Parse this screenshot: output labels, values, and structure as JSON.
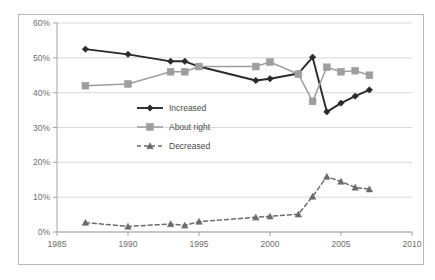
{
  "chart_data": {
    "type": "line",
    "title": "",
    "subtitle": "",
    "xlabel": "",
    "ylabel": "",
    "xlim": [
      1985,
      2010
    ],
    "ylim": [
      0,
      60
    ],
    "grid": true,
    "legend_position": "inside-center-left",
    "x_tick_labels": [
      "1985",
      "1990",
      "1995",
      "2000",
      "2005",
      "2010"
    ],
    "x_ticks": [
      1985,
      1990,
      1995,
      2000,
      2005,
      2010
    ],
    "y_tick_labels": [
      "0%",
      "10%",
      "20%",
      "30%",
      "40%",
      "50%",
      "60%"
    ],
    "y_ticks": [
      0,
      10,
      20,
      30,
      40,
      50,
      60
    ],
    "y_unit": "%",
    "series": [
      {
        "name": "Increased",
        "color": "#2a2a2a",
        "line_style": "solid",
        "marker": "diamond",
        "x": [
          1987,
          1990,
          1993,
          1994,
          1995,
          1999,
          2000,
          2002,
          2003,
          2004,
          2005,
          2006,
          2007
        ],
        "values": [
          52.5,
          51.0,
          49.0,
          49.0,
          47.5,
          43.5,
          44.0,
          45.5,
          50.2,
          34.5,
          37.0,
          39.0,
          40.8
        ]
      },
      {
        "name": "About right",
        "color": "#9e9e9e",
        "line_style": "solid",
        "marker": "square",
        "x": [
          1987,
          1990,
          1993,
          1994,
          1995,
          1999,
          2000,
          2002,
          2003,
          2004,
          2005,
          2006,
          2007
        ],
        "values": [
          42.0,
          42.5,
          46.0,
          46.0,
          47.5,
          47.5,
          48.8,
          45.3,
          37.5,
          47.3,
          46.0,
          46.3,
          45.0
        ]
      },
      {
        "name": "Decreased",
        "color": "#6b6b6b",
        "line_style": "dashed",
        "marker": "triangle",
        "x": [
          1987,
          1990,
          1993,
          1994,
          1995,
          1999,
          2000,
          2002,
          2003,
          2004,
          2005,
          2006,
          2007
        ],
        "values": [
          2.7,
          1.6,
          2.3,
          1.9,
          3.0,
          4.2,
          4.5,
          5.1,
          10.2,
          15.9,
          14.5,
          12.8,
          12.3
        ]
      }
    ],
    "legend_entries": [
      {
        "label": "Increased",
        "color": "#2a2a2a",
        "marker": "diamond",
        "line_style": "solid"
      },
      {
        "label": "About right",
        "color": "#9e9e9e",
        "marker": "square",
        "line_style": "solid"
      },
      {
        "label": "Decreased",
        "color": "#6b6b6b",
        "marker": "triangle",
        "line_style": "dashed"
      }
    ]
  },
  "colors": {
    "increased": "#2a2a2a",
    "about_right": "#9e9e9e",
    "decreased": "#6b6b6b",
    "grid": "#cfcfcf",
    "axis": "#9a9a9a",
    "frame": "#b8b8b8",
    "tick_text": "#6e6e6e",
    "legend_text": "#4a4a4a",
    "background": "#ffffff"
  }
}
